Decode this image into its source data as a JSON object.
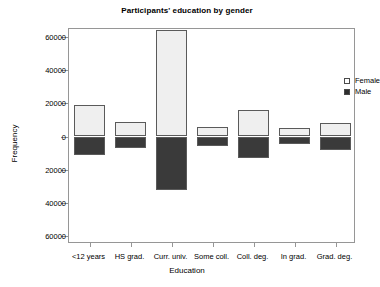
{
  "chart_data": {
    "type": "bar",
    "title": "Participants' education by gender",
    "xlabel": "Education",
    "ylabel": "Frequency",
    "categories": [
      "<12 years",
      "HS grad.",
      "Curr. univ.",
      "Some coll.",
      "Coll. deg.",
      "In grad.",
      "Grad. deg."
    ],
    "series": [
      {
        "name": "Female",
        "values": [
          18900,
          8800,
          64400,
          5700,
          15800,
          5000,
          8300
        ]
      },
      {
        "name": "Male",
        "values": [
          11400,
          6900,
          32200,
          5700,
          12700,
          4700,
          7900
        ]
      }
    ],
    "orientation": "back-to-back stacked (female above axis, male below axis)",
    "ylim": [
      -65000,
      65000
    ],
    "ytick_values": [
      60000,
      40000,
      20000,
      0,
      -20000,
      -40000,
      -60000
    ],
    "ytick_labels": [
      "60000",
      "40000",
      "20000",
      "0",
      "20000",
      "40000",
      "60000"
    ],
    "grid": false,
    "legend_position": "top-right inside plot",
    "colors": {
      "female": "#efefef",
      "male": "#3a3a3a",
      "axis": "#969696",
      "bar_border": "#5a5a5a",
      "background": "#ffffff"
    }
  },
  "legend": {
    "items": [
      {
        "label": "Female",
        "swatch": "open-square-icon"
      },
      {
        "label": "Male",
        "swatch": "filled-square-icon"
      }
    ]
  }
}
